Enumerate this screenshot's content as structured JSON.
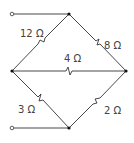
{
  "diagram": {
    "type": "resistor bridge circuit",
    "colors": {
      "wire": "#333333",
      "text": "#444444",
      "background": "#ffffff"
    },
    "resistors": [
      {
        "id": "r_top_left",
        "label": "12 Ω",
        "value_ohms": 12
      },
      {
        "id": "r_top_right",
        "label": "8 Ω",
        "value_ohms": 8
      },
      {
        "id": "r_middle",
        "label": "4 Ω",
        "value_ohms": 4
      },
      {
        "id": "r_bottom_left",
        "label": "3 Ω",
        "value_ohms": 3
      },
      {
        "id": "r_bottom_right",
        "label": "2 Ω",
        "value_ohms": 2
      }
    ],
    "terminals": [
      {
        "id": "terminal_top",
        "connects_to": "top node"
      },
      {
        "id": "terminal_bottom",
        "connects_to": "bottom node"
      }
    ]
  }
}
